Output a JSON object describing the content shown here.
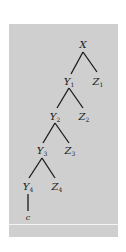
{
  "diagram": {
    "type": "tree",
    "background_color": "#cfcfcf",
    "line_color": "#1a1a1a",
    "nodes": [
      {
        "id": "X",
        "base": "X",
        "sub": "",
        "x": 83,
        "y": 45
      },
      {
        "id": "Y1",
        "base": "Y",
        "sub": "1",
        "x": 69,
        "y": 82
      },
      {
        "id": "Z1",
        "base": "Z",
        "sub": "1",
        "x": 98,
        "y": 82
      },
      {
        "id": "Y2",
        "base": "Y",
        "sub": "2",
        "x": 55,
        "y": 117
      },
      {
        "id": "Z2",
        "base": "Z",
        "sub": "2",
        "x": 84,
        "y": 117
      },
      {
        "id": "Y3",
        "base": "Y",
        "sub": "3",
        "x": 42,
        "y": 151
      },
      {
        "id": "Z3",
        "base": "Z",
        "sub": "3",
        "x": 70,
        "y": 151
      },
      {
        "id": "Y4",
        "base": "Y",
        "sub": "4",
        "x": 28,
        "y": 187
      },
      {
        "id": "Z4",
        "base": "Z",
        "sub": "4",
        "x": 57,
        "y": 187
      },
      {
        "id": "c",
        "base": "c",
        "sub": "",
        "x": 28,
        "y": 218
      }
    ],
    "edges": [
      {
        "from": "X",
        "to": "Y1",
        "x1": 83,
        "y1": 52,
        "x2": 71,
        "y2": 74
      },
      {
        "from": "X",
        "to": "Z1",
        "x1": 83,
        "y1": 52,
        "x2": 97,
        "y2": 72
      },
      {
        "from": "Y1",
        "to": "Y2",
        "x1": 69,
        "y1": 88,
        "x2": 57,
        "y2": 108
      },
      {
        "from": "Y1",
        "to": "Z2",
        "x1": 69,
        "y1": 88,
        "x2": 83,
        "y2": 108
      },
      {
        "from": "Y2",
        "to": "Y3",
        "x1": 55,
        "y1": 123,
        "x2": 43,
        "y2": 143
      },
      {
        "from": "Y2",
        "to": "Z3",
        "x1": 55,
        "y1": 123,
        "x2": 69,
        "y2": 143
      },
      {
        "from": "Y3",
        "to": "Y4",
        "x1": 42,
        "y1": 158,
        "x2": 29,
        "y2": 178
      },
      {
        "from": "Y3",
        "to": "Z4",
        "x1": 42,
        "y1": 158,
        "x2": 55,
        "y2": 178
      },
      {
        "from": "Y4",
        "to": "c",
        "x1": 28,
        "y1": 194,
        "x2": 28,
        "y2": 211
      }
    ]
  }
}
